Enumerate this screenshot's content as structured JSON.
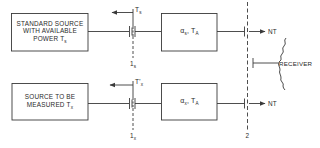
{
  "diagram": {
    "type": "block-diagram",
    "colors": {
      "line": "#3a3a3a",
      "background": "#ffffff"
    },
    "top_path": {
      "source_box": {
        "lines": [
          "STANDARD SOURCE",
          "WITH AVAILABLE",
          "POWER T"
        ],
        "subscript": "s"
      },
      "reflected_label": {
        "text": "T",
        "subscript": "s"
      },
      "plane_label": {
        "text": "1",
        "subscript": "s"
      },
      "network_box": {
        "alpha": "α",
        "alpha_sub": "s",
        "temp": "T",
        "temp_sub": "A"
      },
      "output_label": "NT"
    },
    "bottom_path": {
      "source_box": {
        "lines": [
          "SOURCE TO BE",
          "MEASURED T"
        ],
        "subscript": "x"
      },
      "reflected_label": {
        "text": "T'",
        "subscript": "x"
      },
      "plane_label": {
        "text": "1",
        "subscript": "x"
      },
      "network_box": {
        "alpha": "α",
        "alpha_sub": "x",
        "temp": "T",
        "temp_sub": "A"
      },
      "output_label": "NT"
    },
    "receiver": {
      "label": "RECEIVER"
    },
    "reference_plane_2": {
      "label": "2"
    }
  }
}
